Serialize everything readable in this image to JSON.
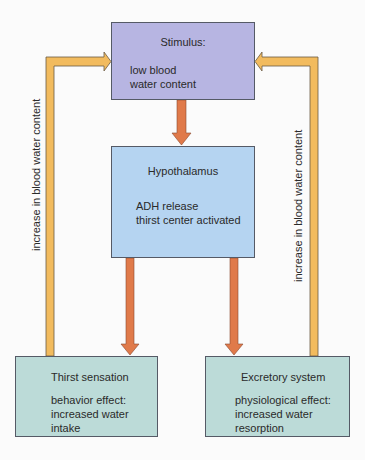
{
  "diagram": {
    "type": "feedback-loop flowchart",
    "nodes": {
      "stimulus": {
        "title": "Stimulus:",
        "body": "low blood\nwater content"
      },
      "hypothalamus": {
        "title": "Hypothalamus",
        "body": "ADH release\nthirst center activated"
      },
      "thirst": {
        "title": "Thirst sensation",
        "body": "behavior effect:\nincreased water\nintake"
      },
      "excretory": {
        "title": "Excretory system",
        "body": "physiological effect:\nincreased water\nresorption"
      }
    },
    "edges": [
      {
        "from": "stimulus",
        "to": "hypothalamus",
        "style": "orange-red"
      },
      {
        "from": "hypothalamus",
        "to": "thirst",
        "style": "orange-red"
      },
      {
        "from": "hypothalamus",
        "to": "excretory",
        "style": "orange-red"
      },
      {
        "from": "thirst",
        "to": "stimulus",
        "style": "yellow-orange",
        "label": "increase in blood water content"
      },
      {
        "from": "excretory",
        "to": "stimulus",
        "style": "yellow-orange",
        "label": "increase in blood water content"
      }
    ],
    "feedback_labels": {
      "left": "increase in blood water content",
      "right": "increase in blood water content"
    },
    "colors": {
      "stimulus_fill": "#b7b5e2",
      "hypothalamus_fill": "#b5d4f1",
      "effector_fill": "#bcdbd8",
      "forward_arrow": "#e07a4a",
      "feedback_arrow": "#f2bb5e",
      "arrow_outline": "#6b5a45"
    }
  }
}
